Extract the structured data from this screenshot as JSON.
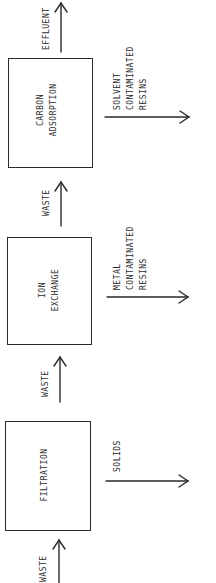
{
  "diagram": {
    "type": "process-flow",
    "orientation": "rotated-90-ccw",
    "stroke_color": "#2a2a2a",
    "background": "#ffffff",
    "process_units": [
      {
        "id": "filtration",
        "label": "FILTRATION"
      },
      {
        "id": "ion_exchange",
        "label": "ION\nEXCHANGE"
      },
      {
        "id": "carbon_adsorption",
        "label": "CARBON\nADSORPTION"
      }
    ],
    "flows": {
      "input_waste": "WASTE",
      "filtration_to_ion_exchange": "WASTE",
      "ion_exchange_to_carbon": "WASTE",
      "output_effluent": "EFFLUENT"
    },
    "byproducts": {
      "filtration": "SOLIDS",
      "ion_exchange": "METAL\nCONTAMINATED\nRESINS",
      "carbon_adsorption": "SOLVENT\nCONTAMINATED\nRESINS"
    },
    "edges": [
      {
        "from": "input",
        "to": "filtration",
        "label": "WASTE"
      },
      {
        "from": "filtration",
        "to": "ion_exchange",
        "label": "WASTE"
      },
      {
        "from": "ion_exchange",
        "to": "carbon_adsorption",
        "label": "WASTE"
      },
      {
        "from": "carbon_adsorption",
        "to": "output",
        "label": "EFFLUENT"
      },
      {
        "from": "filtration",
        "to": "byproduct",
        "label": "SOLIDS"
      },
      {
        "from": "ion_exchange",
        "to": "byproduct",
        "label": "METAL CONTAMINATED RESINS"
      },
      {
        "from": "carbon_adsorption",
        "to": "byproduct",
        "label": "SOLVENT CONTAMINATED RESINS"
      }
    ]
  }
}
